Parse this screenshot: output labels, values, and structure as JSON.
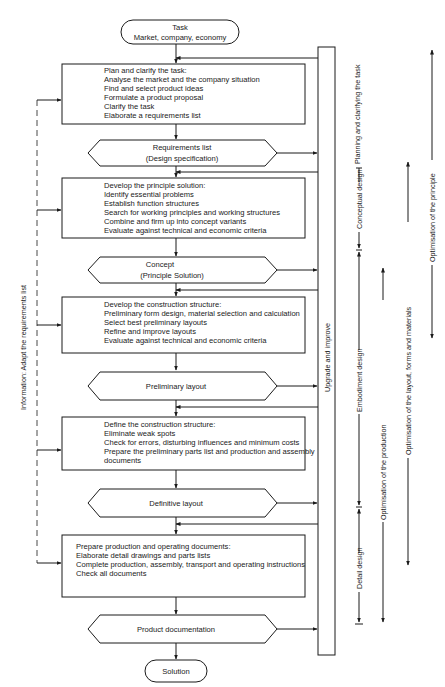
{
  "diagram": {
    "start": {
      "line1": "Task",
      "line2": "Market, company, economy"
    },
    "end": {
      "label": "Solution"
    },
    "steps": [
      {
        "lines": [
          "Plan and clarify the task:",
          "Analyse the market and the company situation",
          "Find and select product ideas",
          "Formulate a product proposal",
          "Clarify the task",
          "Elaborate a requirements list"
        ]
      },
      {
        "lines": [
          "Develop the principle solution:",
          "Identify essential problems",
          "Establish function structures",
          "Search for working principles and working structures",
          "Combine and firm up into concept variants",
          "Evaluate against technical and economic criteria"
        ]
      },
      {
        "lines": [
          "Develop the construction structure:",
          "Preliminary form design, material selection and calculation",
          "Select best preliminary layouts",
          "Refine and improve layouts",
          "Evaluate against technical and economic criteria"
        ]
      },
      {
        "lines": [
          "Define the construction structure:",
          "Eliminate weak spots",
          "Check for errors, disturbing influences and minimum costs",
          "Prepare the preliminary parts list and production and assembly",
          "documents"
        ]
      },
      {
        "lines": [
          "Prepare production and operating documents:",
          "Elaborate detail drawings and parts lists",
          "Complete production, assembly, transport and operating instructions",
          "Check all documents"
        ]
      }
    ],
    "outputs": [
      {
        "line1": "Requirements list",
        "line2": "(Design specification)"
      },
      {
        "line1": "Concept",
        "line2": "(Principle Solution)"
      },
      {
        "line1": "Preliminary layout",
        "line2": ""
      },
      {
        "line1": "Definitive layout",
        "line2": ""
      },
      {
        "line1": "Product documentation",
        "line2": ""
      }
    ],
    "feedback_left": "Information: Adapt the requirements list",
    "feedback_right": "Upgrade and improve",
    "phases": {
      "planning": "Planning and clarifying the task",
      "conceptual": "Conceptual design",
      "embodiment": "Embodiment design",
      "detail": "Detail design"
    },
    "optimisation": {
      "principle": "Optimisation of the principle",
      "layout": "Optimisation of the layout, forms and materials",
      "production": "Optimisation of the production"
    }
  }
}
